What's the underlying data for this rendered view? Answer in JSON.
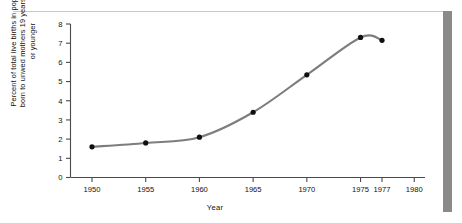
{
  "figure": {
    "top_rule": "",
    "right_bar": ""
  },
  "chart_data": {
    "type": "line",
    "title": "",
    "xlabel": "Year",
    "ylabel": "Percent of total live births in population\nborn to unwed mothers 19 years of age\nor younger",
    "x": [
      1950,
      1955,
      1960,
      1965,
      1970,
      1975,
      1977
    ],
    "values": [
      1.6,
      1.8,
      2.1,
      3.4,
      5.35,
      7.3,
      7.15
    ],
    "xticks": [
      1950,
      1955,
      1960,
      1965,
      1970,
      1975,
      1977,
      1980
    ],
    "xtick_labels": [
      "1950",
      "1955",
      "1960",
      "1965",
      "1970",
      "1975",
      "1977",
      "1980"
    ],
    "yticks": [
      0,
      1,
      2,
      3,
      4,
      5,
      6,
      7,
      8
    ],
    "ytick_labels": [
      "0",
      "1",
      "2",
      "3",
      "4",
      "5",
      "6",
      "7",
      "8"
    ],
    "xlim": [
      1948,
      1981
    ],
    "ylim": [
      0,
      8
    ],
    "grid": false,
    "legend": null,
    "line_color": "#7d7d7d",
    "marker_color": "#101010",
    "axis_color": "#4a4a4a"
  }
}
